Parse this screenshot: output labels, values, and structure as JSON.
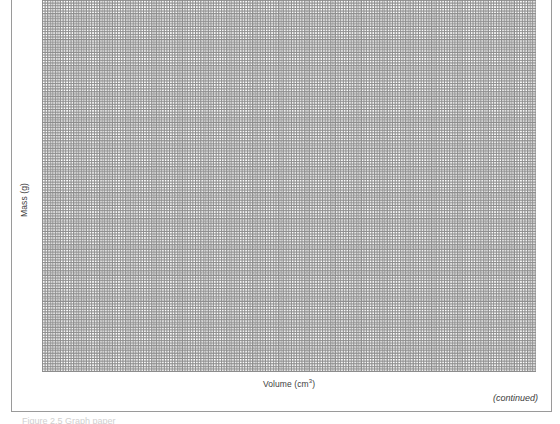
{
  "page": {
    "width": 560,
    "height": 424,
    "background": "#ffffff",
    "frame_color": "#9a9a9a"
  },
  "figure": {
    "y_axis_title": "Mass (g)",
    "x_axis_title_text": "Volume (cm",
    "x_axis_title_superscript": "3",
    "x_axis_title_suffix": ")",
    "continued_note": "(continued)",
    "clipped_caption": "Figure 2.5  Graph paper"
  },
  "chart_data": {
    "type": "scatter",
    "title": "",
    "subtitle": "",
    "xlabel": "Volume (cm^3)",
    "ylabel": "Mass (g)",
    "series": [
      {
        "name": "student-plotted data",
        "x": [],
        "y": []
      }
    ],
    "x": [],
    "values": [],
    "categories": [],
    "xlim": [
      0,
      21
    ],
    "ylim": [
      0,
      16
    ],
    "grid": true,
    "grid_style": "graph-paper-dotted",
    "grid_minor_spacing_px": 4.7,
    "grid_major_spacing_px": 23.5,
    "grid_minor_per_major": 5,
    "grid_major_columns": 21,
    "grid_major_rows": 16,
    "grid_minor_color": "#c6c6c6",
    "grid_major_color": "#8d8d8d",
    "legend": null,
    "legend_position": "none",
    "annotations": [],
    "tick_labels_x": [],
    "tick_labels_y": [],
    "note": "Blank graph paper grid with axis titles only; no data points, tick numbers, or axis lines are drawn."
  }
}
